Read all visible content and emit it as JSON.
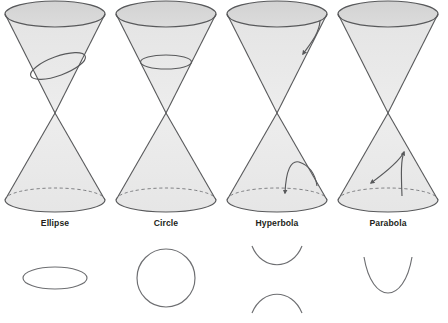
{
  "figure": {
    "background_color": "#ffffff",
    "stroke_color": "#58595b",
    "curve_color": "#6d6e71",
    "cone_fill_upper": "#e2e2e2",
    "cone_fill_lower": "#ebebeb",
    "top_disk_fill": "#d6d6d6",
    "label_color": "#231f20",
    "columns": [
      {
        "id": "ellipse",
        "label": "Ellipse",
        "center_x": 55,
        "label_x": 55,
        "label_y": 226,
        "section_type": "ellipse",
        "cut_description": "oblique plane cutting one nappe at an angle, not parallel to a generator",
        "curve_description": "a single closed flattened oval",
        "curve_center_x": 55,
        "curve_center_y": 278,
        "curve_rx": 32,
        "curve_ry": 11
      },
      {
        "id": "circle",
        "label": "Circle",
        "center_x": 166,
        "label_x": 166,
        "label_y": 226,
        "section_type": "circle",
        "cut_description": "plane parallel to the base cutting one nappe horizontally",
        "curve_description": "a single closed round circle",
        "curve_center_x": 166,
        "curve_center_y": 278,
        "curve_rx": 29,
        "curve_ry": 29
      },
      {
        "id": "hyperbola",
        "label": "Hyperbola",
        "center_x": 277,
        "label_x": 277,
        "label_y": 226,
        "section_type": "hyperbola",
        "cut_description": "plane steeper than the generators cutting both nappes",
        "curve_description": "two opposing open branches, one opening upward and one opening downward",
        "curve_center_x": 277,
        "curve_center_y": 278
      },
      {
        "id": "parabola",
        "label": "Parabola",
        "center_x": 388,
        "label_x": 388,
        "label_y": 226,
        "section_type": "parabola",
        "cut_description": "plane parallel to a generator cutting one nappe",
        "curve_description": "a single open upward-opening curve",
        "curve_center_x": 388,
        "curve_center_y": 278
      }
    ],
    "cone_geometry": {
      "top_y": 14,
      "top_rx": 50,
      "top_ry": 13,
      "apex_y": 113,
      "bottom_y": 200,
      "bottom_rx": 50,
      "bottom_ry": 12
    }
  }
}
